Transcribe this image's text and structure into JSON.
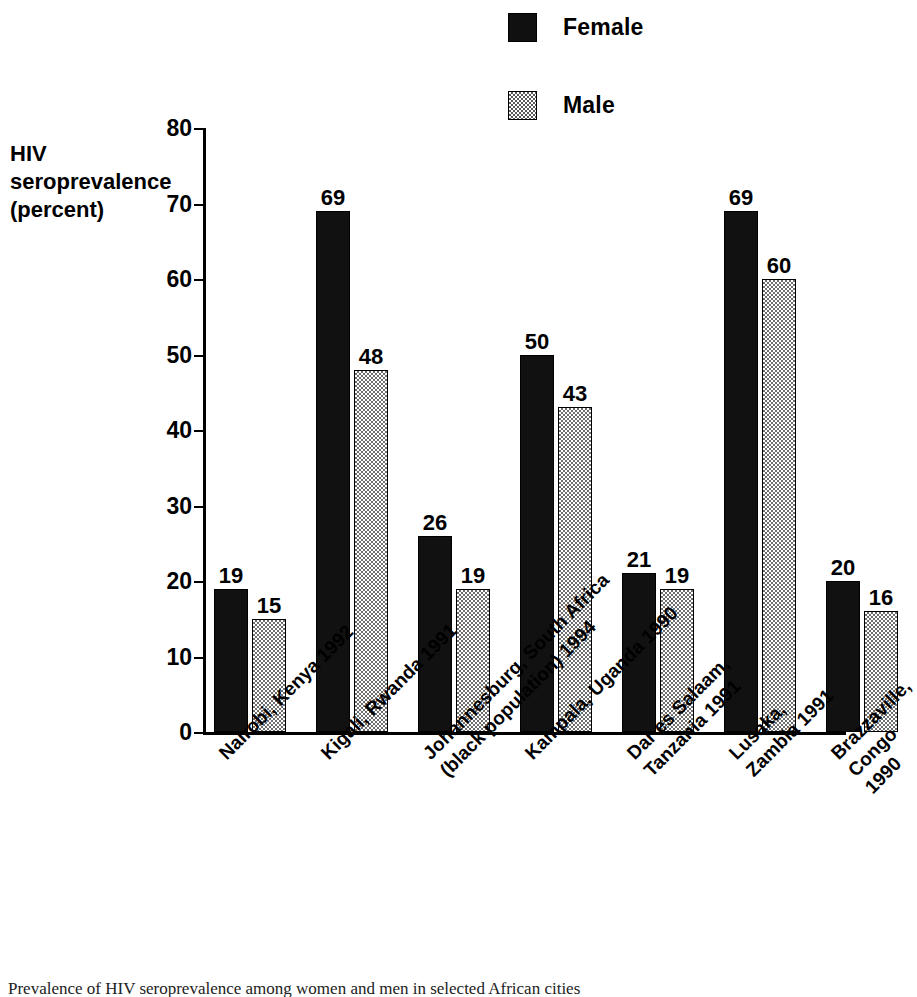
{
  "chart_data": {
    "type": "bar",
    "title": "",
    "xlabel": "",
    "ylabel": "HIV\nseroprevalence\n(percent)",
    "ylim": [
      0,
      80
    ],
    "ytick_values": [
      80,
      70,
      60,
      50,
      40,
      30,
      20,
      10,
      0
    ],
    "ytick_labels": [
      "80",
      "70",
      "60",
      "50",
      "40",
      "30",
      "20",
      "10",
      "0"
    ],
    "grid": false,
    "legend_position": "top-right",
    "categories": [
      "Nairobi, Kenya 1992",
      "Kigali, Rwanda 1991",
      "Johannesburg, South Africa\n(black population) 1994",
      "Kampala, Uganda 1990",
      "Dar es Salaam,\nTanzania 1991",
      "Lusaka, Zambia 1991",
      "Brazzaville, Congo 1990"
    ],
    "series": [
      {
        "name": "Female",
        "color": "#111111",
        "pattern": "solid",
        "values": [
          19,
          69,
          26,
          50,
          21,
          69,
          20
        ]
      },
      {
        "name": "Male",
        "color": "#6e6e6e",
        "pattern": "checker-stipple",
        "values": [
          15,
          48,
          19,
          43,
          19,
          60,
          16
        ]
      }
    ],
    "value_labels_shown": true
  },
  "legend": {
    "items": [
      {
        "label": "Female",
        "swatch": "solid-black-swatch"
      },
      {
        "label": "Male",
        "swatch": "stippled-gray-swatch"
      }
    ]
  },
  "caption": {
    "text": "Prevalence of HIV seroprevalence among women and men in selected African cities"
  }
}
